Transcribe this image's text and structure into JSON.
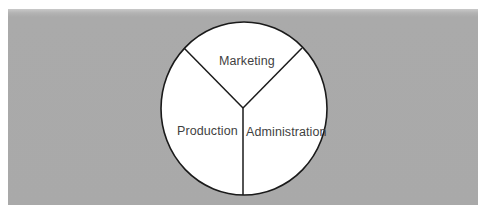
{
  "diagram": {
    "type": "divided-circle",
    "sectors": [
      {
        "id": "marketing",
        "label": "Marketing"
      },
      {
        "id": "production",
        "label": "Production"
      },
      {
        "id": "administration",
        "label": "Administration"
      }
    ],
    "colors": {
      "panel_background": "#a9a9a9",
      "circle_fill": "#ffffff",
      "stroke": "#1a1a1a",
      "label_text": "#3f3f3f"
    }
  }
}
